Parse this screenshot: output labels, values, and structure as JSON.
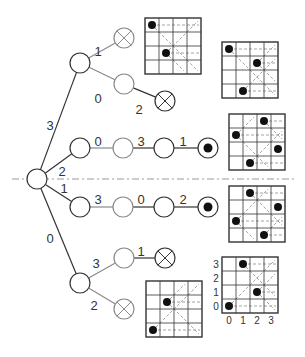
{
  "colors": {
    "dark_line": "#333333",
    "light_line": "#8a8a8a",
    "dash": "#9a9a9a",
    "queen": "#111111",
    "background": "#ffffff"
  },
  "symmetry_axis": {
    "y": 179,
    "x1": 12,
    "x2": 294,
    "style": "dash-dot"
  },
  "tree": {
    "nodes": [
      {
        "id": "root",
        "x": 37,
        "y": 179,
        "type": "open",
        "shade": "dark"
      },
      {
        "id": "n3",
        "x": 80,
        "y": 63,
        "type": "open",
        "shade": "dark"
      },
      {
        "id": "n3-1",
        "x": 124,
        "y": 38,
        "type": "dead",
        "shade": "light"
      },
      {
        "id": "n3-0",
        "x": 124,
        "y": 84,
        "type": "open",
        "shade": "light"
      },
      {
        "id": "n3-0-2",
        "x": 165,
        "y": 101,
        "type": "dead",
        "shade": "dark"
      },
      {
        "id": "n2",
        "x": 80,
        "y": 148,
        "type": "open",
        "shade": "dark"
      },
      {
        "id": "n2-0",
        "x": 123,
        "y": 148,
        "type": "open",
        "shade": "light"
      },
      {
        "id": "n2-0-3",
        "x": 164,
        "y": 148,
        "type": "open",
        "shade": "dark"
      },
      {
        "id": "n2-0-3-1",
        "x": 208,
        "y": 148,
        "type": "solution",
        "shade": "dark"
      },
      {
        "id": "n1",
        "x": 80,
        "y": 207,
        "type": "open",
        "shade": "dark"
      },
      {
        "id": "n1-3",
        "x": 123,
        "y": 207,
        "type": "open",
        "shade": "light"
      },
      {
        "id": "n1-3-0",
        "x": 164,
        "y": 207,
        "type": "open",
        "shade": "dark"
      },
      {
        "id": "n1-3-0-2",
        "x": 208,
        "y": 207,
        "type": "solution",
        "shade": "dark"
      },
      {
        "id": "n0",
        "x": 80,
        "y": 283,
        "type": "open",
        "shade": "dark"
      },
      {
        "id": "n0-3",
        "x": 124,
        "y": 258,
        "type": "open",
        "shade": "light"
      },
      {
        "id": "n0-3-1",
        "x": 165,
        "y": 258,
        "type": "dead",
        "shade": "dark"
      },
      {
        "id": "n0-2",
        "x": 124,
        "y": 309,
        "type": "dead",
        "shade": "light"
      }
    ],
    "edges": [
      {
        "from": "root",
        "to": "n3",
        "label": "3",
        "lx": 50,
        "ly": 130
      },
      {
        "from": "n3",
        "to": "n3-1",
        "label": "1",
        "lx": 98,
        "ly": 56
      },
      {
        "from": "n3",
        "to": "n3-0",
        "label": "0",
        "lx": 98,
        "ly": 103
      },
      {
        "from": "n3-0",
        "to": "n3-0-2",
        "label": "2",
        "lx": 139,
        "ly": 114
      },
      {
        "from": "root",
        "to": "n2",
        "label": "2",
        "lx": 62,
        "ly": 176
      },
      {
        "from": "n2",
        "to": "n2-0",
        "label": "0",
        "lx": 98,
        "ly": 146
      },
      {
        "from": "n2-0",
        "to": "n2-0-3",
        "label": "3",
        "lx": 141,
        "ly": 146
      },
      {
        "from": "n2-0-3",
        "to": "n2-0-3-1",
        "label": "1",
        "lx": 183,
        "ly": 146
      },
      {
        "from": "root",
        "to": "n1",
        "label": "1",
        "lx": 64,
        "ly": 193
      },
      {
        "from": "n1",
        "to": "n1-3",
        "label": "3",
        "lx": 98,
        "ly": 204
      },
      {
        "from": "n1-3",
        "to": "n1-3-0",
        "label": "0",
        "lx": 141,
        "ly": 204
      },
      {
        "from": "n1-3-0",
        "to": "n1-3-0-2",
        "label": "2",
        "lx": 183,
        "ly": 204
      },
      {
        "from": "root",
        "to": "n0",
        "label": "0",
        "lx": 50,
        "ly": 243
      },
      {
        "from": "n0",
        "to": "n0-3",
        "label": "3",
        "lx": 96,
        "ly": 268
      },
      {
        "from": "n0-3",
        "to": "n0-3-1",
        "label": "1",
        "lx": 141,
        "ly": 256
      },
      {
        "from": "n0",
        "to": "n0-2",
        "label": "2",
        "lx": 94,
        "ly": 310
      }
    ]
  },
  "boards": [
    {
      "id": "board-3-1",
      "x": 145,
      "y": 18,
      "size": 56,
      "queens": [
        [
          0,
          3
        ],
        [
          1,
          1
        ]
      ]
    },
    {
      "id": "board-3-0-2",
      "x": 222,
      "y": 42,
      "size": 56,
      "queens": [
        [
          0,
          3
        ],
        [
          2,
          2
        ],
        [
          1,
          0
        ]
      ]
    },
    {
      "id": "board-2-0-3-1",
      "x": 229,
      "y": 114,
      "size": 56,
      "queens": [
        [
          2,
          3
        ],
        [
          0,
          2
        ],
        [
          3,
          1
        ],
        [
          1,
          0
        ]
      ]
    },
    {
      "id": "board-1-3-0-2",
      "x": 229,
      "y": 186,
      "size": 56,
      "queens": [
        [
          1,
          3
        ],
        [
          3,
          2
        ],
        [
          0,
          1
        ],
        [
          2,
          0
        ]
      ]
    },
    {
      "id": "board-0-2",
      "x": 146,
      "y": 281,
      "size": 56,
      "queens": [
        [
          1,
          2
        ],
        [
          0,
          0
        ]
      ]
    },
    {
      "id": "board-0-3-1",
      "x": 222,
      "y": 257,
      "size": 56,
      "queens": [
        [
          1,
          3
        ],
        [
          2,
          1
        ],
        [
          0,
          0
        ]
      ]
    }
  ],
  "axes_board": {
    "board_id": "board-0-3-1",
    "y_labels": [
      "3",
      "2",
      "1",
      "0"
    ],
    "x_labels": [
      "0",
      "1",
      "2",
      "3"
    ]
  }
}
